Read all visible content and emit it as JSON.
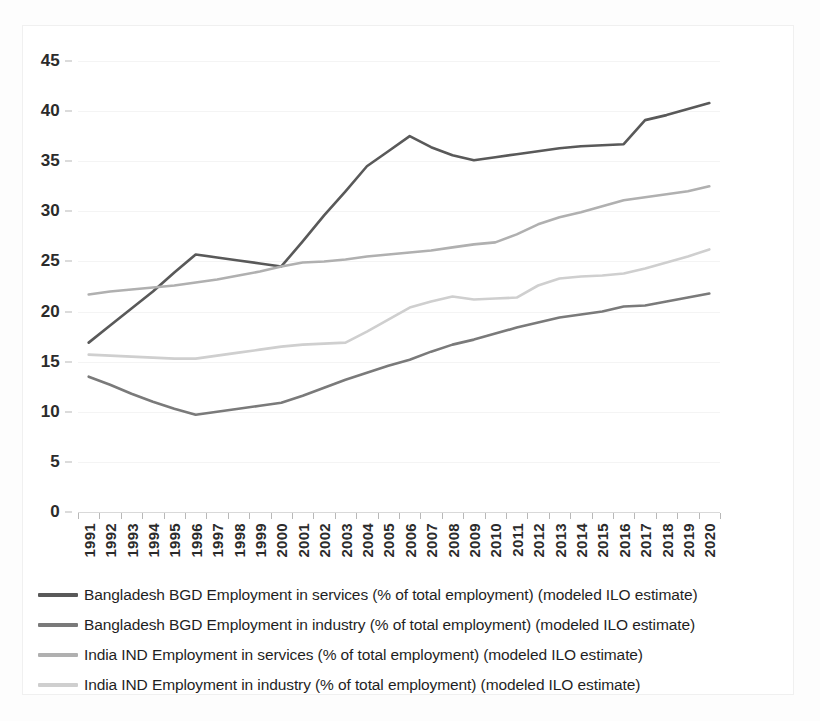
{
  "chart_data": {
    "type": "line",
    "title": "",
    "xlabel": "",
    "ylabel": "",
    "ylim": [
      0,
      45
    ],
    "yticks": [
      0,
      5,
      10,
      15,
      20,
      25,
      30,
      35,
      40,
      45
    ],
    "grid": true,
    "legend_position": "bottom",
    "categories": [
      "1991",
      "1992",
      "1993",
      "1994",
      "1995",
      "1996",
      "1997",
      "1998",
      "1999",
      "2000",
      "2001",
      "2002",
      "2003",
      "2004",
      "2005",
      "2006",
      "2007",
      "2008",
      "2009",
      "2010",
      "2011",
      "2012",
      "2013",
      "2014",
      "2015",
      "2016",
      "2017",
      "2018",
      "2019",
      "2020"
    ],
    "series": [
      {
        "name": "Bangladesh BGD Employment in services (% of total employment) (modeled ILO estimate)",
        "color": "#595959",
        "values": [
          16.9,
          18.6,
          20.3,
          22.0,
          23.9,
          25.7,
          25.4,
          25.1,
          24.8,
          24.5,
          27.0,
          29.6,
          32.0,
          34.5,
          36.0,
          37.5,
          36.4,
          35.6,
          35.1,
          35.4,
          35.7,
          36.0,
          36.3,
          36.5,
          36.6,
          36.7,
          39.1,
          39.6,
          40.2,
          40.8
        ]
      },
      {
        "name": "Bangladesh BGD Employment in industry (% of total employment) (modeled ILO estimate)",
        "color": "#7a7a7a",
        "values": [
          13.5,
          12.7,
          11.8,
          11.0,
          10.3,
          9.7,
          10.0,
          10.3,
          10.6,
          10.9,
          11.6,
          12.4,
          13.2,
          13.9,
          14.6,
          15.2,
          16.0,
          16.7,
          17.2,
          17.8,
          18.4,
          18.9,
          19.4,
          19.7,
          20.0,
          20.5,
          20.6,
          21.0,
          21.4,
          21.8
        ]
      },
      {
        "name": "India IND Employment in services (% of total employment) (modeled ILO estimate)",
        "color": "#b0b0b0",
        "values": [
          21.7,
          22.0,
          22.2,
          22.4,
          22.6,
          22.9,
          23.2,
          23.6,
          24.0,
          24.5,
          24.9,
          25.0,
          25.2,
          25.5,
          25.7,
          25.9,
          26.1,
          26.4,
          26.7,
          26.9,
          27.7,
          28.7,
          29.4,
          29.9,
          30.5,
          31.1,
          31.4,
          31.7,
          32.0,
          32.5
        ]
      },
      {
        "name": "India IND Employment in industry (% of total employment) (modeled ILO estimate)",
        "color": "#cfcfcf",
        "values": [
          15.7,
          15.6,
          15.5,
          15.4,
          15.3,
          15.3,
          15.6,
          15.9,
          16.2,
          16.5,
          16.7,
          16.8,
          16.9,
          18.0,
          19.2,
          20.4,
          21.0,
          21.5,
          21.2,
          21.3,
          21.4,
          22.6,
          23.3,
          23.5,
          23.6,
          23.8,
          24.3,
          24.9,
          25.5,
          26.2
        ]
      }
    ]
  },
  "legend": {
    "items": [
      {
        "label": "Bangladesh BGD Employment in services (% of total employment) (modeled ILO estimate)",
        "color": "#595959"
      },
      {
        "label": "Bangladesh BGD Employment in industry (% of total employment) (modeled ILO estimate)",
        "color": "#7a7a7a"
      },
      {
        "label": "India IND Employment in services (% of total employment) (modeled ILO estimate)",
        "color": "#b0b0b0"
      },
      {
        "label": "India IND Employment in industry (% of total employment) (modeled ILO estimate)",
        "color": "#cfcfcf"
      }
    ]
  },
  "colors": {
    "background": "#ffffff",
    "gridline": "#f4f4f4",
    "axis": "#b8b8b8",
    "text": "#2b2b2b"
  }
}
